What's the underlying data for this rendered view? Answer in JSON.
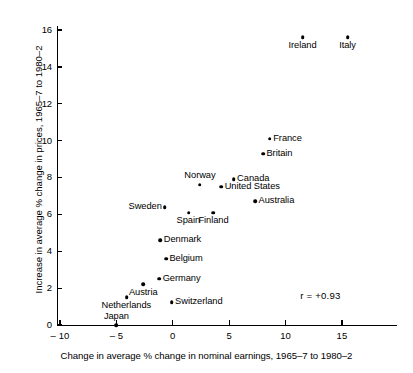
{
  "chart_data": {
    "type": "scatter",
    "title": "",
    "xlabel": "Change in average % change in nominal earnings, 1965–7 to 1980–2",
    "ylabel": "Increase in average % change in prices, 1965–7 to 1980–2",
    "xlim": [
      -10,
      17.5
    ],
    "ylim": [
      -0.6,
      16.6
    ],
    "xticks": [
      -10,
      -5,
      0,
      5,
      10,
      15
    ],
    "xticklabels": [
      "– 10",
      "– 5",
      "0",
      "5",
      "10",
      "15"
    ],
    "yticks": [
      0,
      2,
      4,
      6,
      8,
      10,
      12,
      14,
      16
    ],
    "yticklabels": [
      "0",
      "2",
      "4",
      "6",
      "8",
      "10",
      "12",
      "14",
      "16"
    ],
    "grid": false,
    "legend": null,
    "annotations": [
      {
        "name": "correlation",
        "text": "r = +0.93",
        "x": 11.3,
        "y": 1.6
      }
    ],
    "points": [
      {
        "label": "Italy",
        "x": 15.5,
        "y": 15.6,
        "label_pos": "below"
      },
      {
        "label": "Ireland",
        "x": 11.5,
        "y": 15.6,
        "label_pos": "below"
      },
      {
        "label": "France",
        "x": 8.6,
        "y": 10.1,
        "label_pos": "right"
      },
      {
        "label": "Britain",
        "x": 8.0,
        "y": 9.3,
        "label_pos": "right"
      },
      {
        "label": "Canada",
        "x": 5.4,
        "y": 7.9,
        "label_pos": "right"
      },
      {
        "label": "United States",
        "x": 4.3,
        "y": 7.5,
        "label_pos": "right"
      },
      {
        "label": "Norway",
        "x": 2.4,
        "y": 7.6,
        "label_pos": "above"
      },
      {
        "label": "Australia",
        "x": 7.3,
        "y": 6.7,
        "label_pos": "right"
      },
      {
        "label": "Sweden",
        "x": -0.7,
        "y": 6.4,
        "label_pos": "left"
      },
      {
        "label": "Spain",
        "x": 1.4,
        "y": 6.1,
        "label_pos": "below"
      },
      {
        "label": "Finland",
        "x": 3.6,
        "y": 6.1,
        "label_pos": "below"
      },
      {
        "label": "Denmark",
        "x": -1.1,
        "y": 4.6,
        "label_pos": "right"
      },
      {
        "label": "Belgium",
        "x": -0.6,
        "y": 3.6,
        "label_pos": "right"
      },
      {
        "label": "Germany",
        "x": -1.2,
        "y": 2.5,
        "label_pos": "right"
      },
      {
        "label": "Austria",
        "x": -2.6,
        "y": 2.2,
        "label_pos": "below"
      },
      {
        "label": "Netherlands",
        "x": -4.1,
        "y": 1.5,
        "label_pos": "below"
      },
      {
        "label": "Switzerland",
        "x": -0.1,
        "y": 1.25,
        "label_pos": "right"
      },
      {
        "label": "Japan",
        "x": -5.0,
        "y": 0.0,
        "label_pos": "above"
      }
    ]
  }
}
